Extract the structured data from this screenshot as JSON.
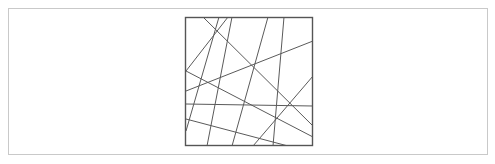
{
  "figure": {
    "title": "Random chords crossing a square",
    "background_color": "#ffffff",
    "outer_border": {
      "name": "outer-frame",
      "x": 8.5,
      "y": 8.5,
      "width": 479,
      "height": 146,
      "stroke": "#c9c9c9",
      "stroke_width": 1,
      "fill": "none"
    },
    "square": {
      "name": "inner-square",
      "x": 185.5,
      "y": 17.5,
      "width": 127,
      "height": 128,
      "stroke": "#555555",
      "stroke_width": 1.4,
      "fill": "none"
    },
    "lines": {
      "stroke": "#5a5a5a",
      "stroke_width": 1,
      "count": 9,
      "segments": [
        {
          "id": "line-1",
          "x1": 186,
          "y1": 131,
          "x2": 219,
          "y2": 17,
          "label": "steep left diagonal"
        },
        {
          "id": "line-2",
          "x1": 203,
          "y1": 17,
          "x2": 313,
          "y2": 126,
          "label": "top-left to right-lower diagonal"
        },
        {
          "id": "line-3",
          "x1": 228,
          "y1": 17,
          "x2": 186,
          "y2": 71,
          "label": "short top to left-edge diagonal"
        },
        {
          "id": "line-4",
          "x1": 186,
          "y1": 91,
          "x2": 313,
          "y2": 41,
          "label": "left-mid to right-upper rising line"
        },
        {
          "id": "line-5",
          "x1": 186,
          "y1": 104,
          "x2": 313,
          "y2": 106,
          "label": "near-horizontal span with slight dip"
        },
        {
          "id": "line-6",
          "x1": 186,
          "y1": 119,
          "x2": 288,
          "y2": 146,
          "label": "left-lower to bottom-right line"
        },
        {
          "id": "line-7",
          "x1": 207,
          "y1": 146,
          "x2": 232,
          "y2": 17,
          "label": "steep bottom-to-top line"
        },
        {
          "id": "line-8",
          "x1": 268,
          "y1": 17,
          "x2": 232,
          "y2": 146,
          "label": "steep top-to-bottom line"
        },
        {
          "id": "line-9",
          "x1": 284,
          "y1": 17,
          "x2": 273,
          "y2": 146,
          "label": "right steep top-to-bottom line"
        },
        {
          "id": "line-10",
          "x1": 313,
          "y1": 76,
          "x2": 253,
          "y2": 146,
          "label": "right-edge to bottom diagonal"
        },
        {
          "id": "line-11",
          "x1": 186,
          "y1": 71,
          "x2": 313,
          "y2": 137,
          "label": "left-upper to right-lower long chord"
        }
      ]
    }
  }
}
